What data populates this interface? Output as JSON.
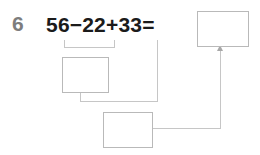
{
  "worksheet": {
    "problem_number": "6",
    "equation": {
      "full_text": "56−22+33=",
      "operand_1": "56",
      "operator_1": "−",
      "operand_2": "22",
      "operator_2": "+",
      "operand_3": "33",
      "equals": "="
    },
    "boxes": {
      "intermediate_result": "",
      "second_intermediate_result": "",
      "final_answer": ""
    },
    "colors": {
      "problem_number": "#7d7d7d",
      "equation_text": "#1b1b1b",
      "box_border": "#b9b9b9",
      "connector": "#c6c6c6",
      "page_background": "#ffffff"
    }
  }
}
